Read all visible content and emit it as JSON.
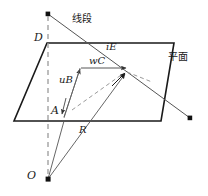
{
  "figure": {
    "type": "geometry-diagram",
    "colors": {
      "stroke_dark": "#1a1a1a",
      "stroke_medium": "#555555",
      "stroke_light": "#888888",
      "dash_gray": "#999999",
      "background": "#ffffff",
      "text": "#1a1a1a"
    },
    "labels": {
      "line_segment": "线段",
      "plane": "平面",
      "point_d": "D",
      "point_a": "A",
      "point_o": "O",
      "vector_ub": "uB",
      "vector_wc": "wC",
      "vector_ie": "iE",
      "vector_r": "R"
    },
    "label_positions": {
      "line_segment": {
        "x": 72,
        "y": 20
      },
      "plane": {
        "x": 168,
        "y": 58
      },
      "point_d": {
        "x": 36,
        "y": 37
      },
      "point_a": {
        "x": 52,
        "y": 110
      },
      "point_o": {
        "x": 29,
        "y": 175
      },
      "vector_ub": {
        "x": 60,
        "y": 79
      },
      "vector_wc": {
        "x": 90,
        "y": 62
      },
      "vector_ie": {
        "x": 107,
        "y": 47
      },
      "vector_r": {
        "x": 80,
        "y": 130
      }
    },
    "geometry": {
      "plane_polygon": "47,43 174,43 161,121 14,121",
      "segment_start": {
        "x": 48,
        "y": 14
      },
      "segment_end": {
        "x": 190,
        "y": 118
      },
      "origin": {
        "x": 48,
        "y": 179
      },
      "point_a": {
        "x": 62,
        "y": 121
      },
      "point_d": {
        "x": 47,
        "y": 43
      },
      "intersection": {
        "x": 126,
        "y": 72
      },
      "vec_b_tip": {
        "x": 80,
        "y": 68
      },
      "vertical_axis_top": {
        "x": 48,
        "y": 14
      },
      "vertical_axis_bottom": {
        "x": 48,
        "y": 179
      }
    }
  }
}
